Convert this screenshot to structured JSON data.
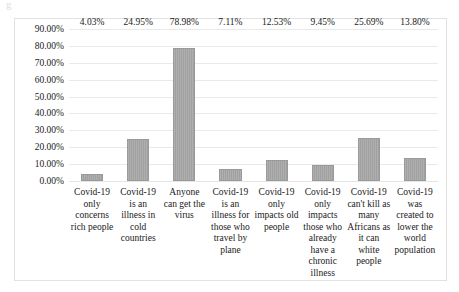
{
  "artifact": {
    "glyph": "g"
  },
  "chart_data": {
    "type": "bar",
    "title": "",
    "subtitle": "",
    "xlabel": "",
    "ylabel": "",
    "grid": true,
    "legend": false,
    "orientation": "vertical",
    "bar_color": "#a6a6a6",
    "bar_border_color": "#9a9a9a",
    "gridline_color": "#e9e9e9",
    "frame_color": "#e2e2e2",
    "background_color": "#ffffff",
    "ylim": [
      0,
      90
    ],
    "ytick_labels": [
      "90.00%",
      "80.00%",
      "70.00%",
      "60.00%",
      "50.00%",
      "40.00%",
      "30.00%",
      "20.00%",
      "10.00%",
      "0.00%"
    ],
    "ytick_values": [
      90,
      80,
      70,
      60,
      50,
      40,
      30,
      20,
      10,
      0
    ],
    "categories": [
      "Covid-19 only concerns rich people",
      "Covid-19 is an illness in cold countries",
      "Anyone can get the virus",
      "Covid-19 is an illness for those who travel by plane",
      "Covid-19 only impacts old people",
      "Covid-19 only impacts those who already have a chronic illness",
      "Covid-19 can't kill as many Africans as it can white people",
      "Covid-19 was created to lower the world population"
    ],
    "values": [
      4.03,
      24.95,
      78.98,
      7.11,
      12.53,
      9.45,
      25.69,
      13.8
    ],
    "data_labels": [
      "4.03%",
      "24.95%",
      "78.98%",
      "7.11%",
      "12.53%",
      "9.45%",
      "25.69%",
      "13.80%"
    ]
  }
}
